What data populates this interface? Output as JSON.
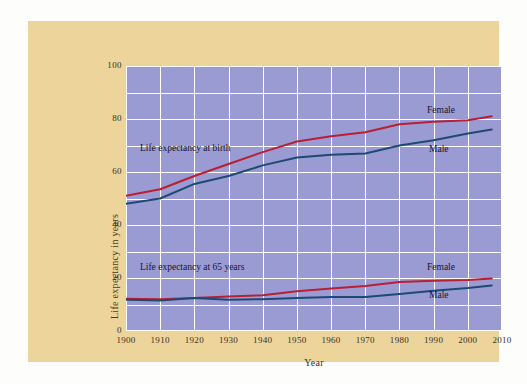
{
  "figure": {
    "background_color": "#fdfdfb",
    "panel_color": "#ecd49a",
    "plot_background_color": "#9b9bd4",
    "grid_color": "#ffffff"
  },
  "annotations": {
    "at_birth": "Life expectancy at birth",
    "at_65": "Life expectancy at 65 years",
    "birth_female": "Female",
    "birth_male": "Male",
    "age65_female": "Female",
    "age65_male": "Male"
  },
  "chart_data": {
    "type": "line",
    "title": "",
    "xlabel": "Year",
    "ylabel": "Life expectancy in years",
    "xlim": [
      1900,
      2010
    ],
    "ylim": [
      0,
      100
    ],
    "grid": true,
    "legend_position": "inline-annotations",
    "xticks": [
      1900,
      1910,
      1920,
      1930,
      1940,
      1950,
      1960,
      1970,
      1980,
      1990,
      2000,
      2010
    ],
    "xtick_labels": [
      "1900",
      "1910",
      "1920",
      "1930",
      "1940",
      "1950",
      "1960",
      "1970",
      "1980",
      "1990",
      "2000",
      "2010"
    ],
    "yticks": [
      0,
      20,
      40,
      60,
      80,
      100
    ],
    "ytick_labels": [
      "0",
      "20",
      "40",
      "60",
      "80",
      "100"
    ],
    "ygrid_minor_step": 10,
    "colors": {
      "female": "#b81f33",
      "male": "#1d4a73"
    },
    "x": [
      1900,
      1910,
      1920,
      1930,
      1940,
      1950,
      1960,
      1970,
      1980,
      1990,
      2000,
      2007
    ],
    "series": [
      {
        "name": "Life expectancy at birth — Female",
        "group": "at_birth",
        "sex": "Female",
        "color": "#b81f33",
        "values": [
          51.0,
          53.5,
          58.5,
          63.0,
          67.5,
          71.5,
          73.5,
          75.0,
          78.0,
          79.0,
          79.5,
          81.0
        ]
      },
      {
        "name": "Life expectancy at birth — Male",
        "group": "at_birth",
        "sex": "Male",
        "color": "#1d4a73",
        "values": [
          48.0,
          50.0,
          55.5,
          58.5,
          62.5,
          65.5,
          66.5,
          67.0,
          70.0,
          72.0,
          74.5,
          76.0
        ]
      },
      {
        "name": "Life expectancy at 65 — Female",
        "group": "at_65",
        "sex": "Female",
        "color": "#b81f33",
        "values": [
          12.2,
          12.0,
          12.5,
          13.0,
          13.5,
          15.0,
          16.0,
          17.0,
          18.5,
          19.0,
          19.2,
          19.8
        ]
      },
      {
        "name": "Life expectancy at 65 — Male",
        "group": "at_65",
        "sex": "Male",
        "color": "#1d4a73",
        "values": [
          11.8,
          11.5,
          12.5,
          11.8,
          12.0,
          12.5,
          12.8,
          12.8,
          14.0,
          15.2,
          16.2,
          17.2
        ]
      }
    ]
  }
}
